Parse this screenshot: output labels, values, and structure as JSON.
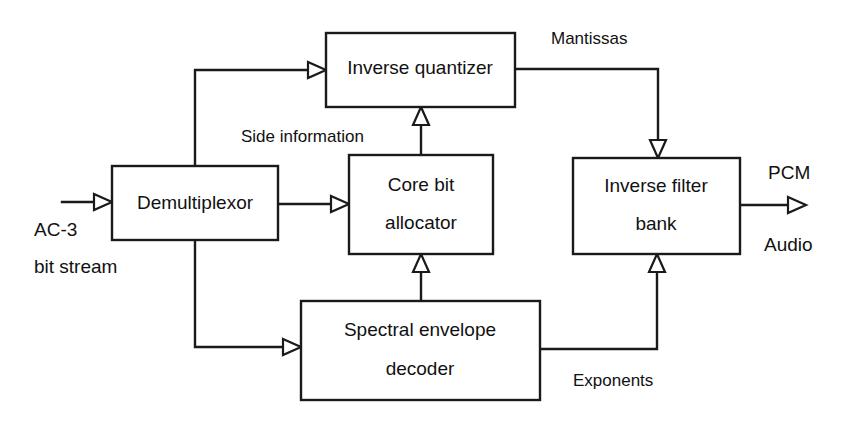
{
  "diagram": {
    "stroke_color": "#1a1a1a",
    "text_color": "#111111",
    "background_color": "#ffffff",
    "nodes": [
      {
        "id": "demultiplexor",
        "label": "Demultiplexor",
        "line1": "Demultiplexor",
        "line2": ""
      },
      {
        "id": "inverse-quantizer",
        "label": "Inverse quantizer",
        "line1": "Inverse quantizer",
        "line2": ""
      },
      {
        "id": "core-bit-allocator",
        "label": "Core bit allocator",
        "line1": "Core bit",
        "line2": "allocator"
      },
      {
        "id": "inverse-filter-bank",
        "label": "Inverse filter bank",
        "line1": "Inverse filter",
        "line2": "bank"
      },
      {
        "id": "spectral-envelope-decoder",
        "label": "Spectral envelope decoder",
        "line1": "Spectral envelope",
        "line2": "decoder"
      }
    ],
    "edge_labels": {
      "side_information": "Side information",
      "mantissas": "Mantissas",
      "exponents": "Exponents"
    },
    "io_labels": {
      "input_line1": "AC-3",
      "input_line2": "bit stream",
      "output_line1": "PCM",
      "output_line2": "Audio"
    }
  }
}
